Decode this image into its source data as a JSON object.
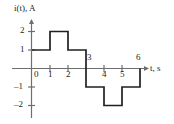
{
  "figure": {
    "kind": "waveform-plot",
    "background_color": "#ffffff",
    "line_color": "#231f20",
    "axis_color": "#6d6e71"
  },
  "chart_data": {
    "type": "line",
    "subtype": "step-piecewise-constant",
    "title": "",
    "xlabel": "t, s",
    "ylabel": "i(t), A",
    "xlim": [
      -0.4,
      6.6
    ],
    "ylim": [
      -2.6,
      2.6
    ],
    "grid": false,
    "legend": null,
    "x_ticks": [
      0,
      1,
      2,
      3,
      4,
      5,
      6
    ],
    "x_tick_labels": [
      "0",
      "1",
      "2",
      "3",
      "4",
      "5",
      "6"
    ],
    "y_ticks": [
      2,
      1,
      -1,
      -2
    ],
    "y_tick_labels": [
      "2",
      "1",
      "-1",
      "-2"
    ],
    "segments": [
      {
        "x_start": 0,
        "x_end": 1,
        "value": 1
      },
      {
        "x_start": 1,
        "x_end": 2,
        "value": 2
      },
      {
        "x_start": 2,
        "x_end": 3,
        "value": 1
      },
      {
        "x_start": 3,
        "x_end": 4,
        "value": -1
      },
      {
        "x_start": 4,
        "x_end": 5,
        "value": -2
      },
      {
        "x_start": 5,
        "x_end": 6,
        "value": -1
      }
    ],
    "x": [
      0,
      1,
      1,
      2,
      2,
      3,
      3,
      4,
      4,
      5,
      5,
      6
    ],
    "values": [
      1,
      1,
      2,
      2,
      1,
      1,
      -1,
      -1,
      -2,
      -2,
      -1,
      -1
    ]
  },
  "labels": {
    "y_axis_name": "i(t), A",
    "y_axis_name_var": "i",
    "y_axis_name_paren_open": "(",
    "y_axis_name_var2": "t",
    "y_axis_name_rest": "), A",
    "x_axis_name_var": "t",
    "x_axis_name_rest": ", s",
    "y_2": "2",
    "y_1": "1",
    "y_m1": "–1",
    "y_m2": "–2",
    "x_0": "0",
    "x_1": "1",
    "x_2": "2",
    "x_3": "3",
    "x_4": "4",
    "x_5": "5",
    "x_6": "6"
  }
}
